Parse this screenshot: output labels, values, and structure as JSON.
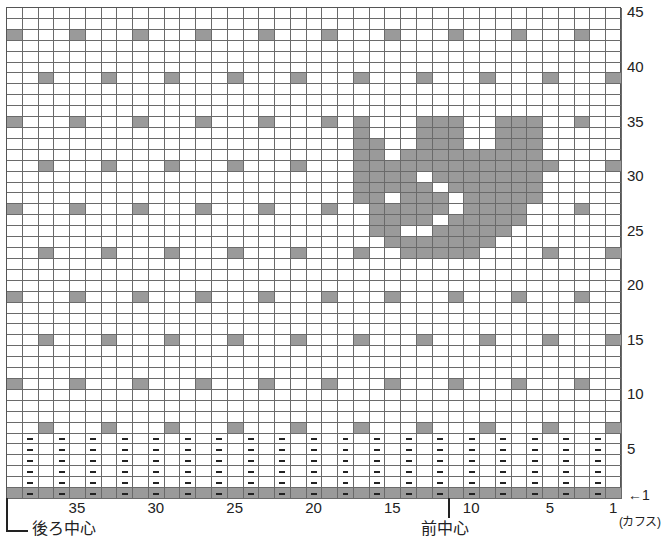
{
  "chart_data": {
    "type": "knitting-chart",
    "title": "",
    "columns": 39,
    "rows": 45,
    "column_numbering": "right-to-left, 1 at right edge",
    "row_numbering": "bottom-to-top, 1 at bottom edge",
    "x_tick_labels": [
      {
        "col": 35,
        "label": "35"
      },
      {
        "col": 30,
        "label": "30"
      },
      {
        "col": 25,
        "label": "25"
      },
      {
        "col": 20,
        "label": "20"
      },
      {
        "col": 15,
        "label": "15"
      },
      {
        "col": 10,
        "label": "10"
      },
      {
        "col": 5,
        "label": "5"
      },
      {
        "col": 1,
        "label": "1"
      }
    ],
    "y_tick_labels": [
      {
        "row": 5,
        "label": "5"
      },
      {
        "row": 10,
        "label": "10"
      },
      {
        "row": 15,
        "label": "15"
      },
      {
        "row": 20,
        "label": "20"
      },
      {
        "row": 25,
        "label": "25"
      },
      {
        "row": 30,
        "label": "30"
      },
      {
        "row": 35,
        "label": "35"
      },
      {
        "row": 40,
        "label": "40"
      },
      {
        "row": 45,
        "label": "45"
      }
    ],
    "start_row_marker": {
      "row": 1,
      "label": "←1"
    },
    "cuff_label": "(カフス)",
    "center_markers": [
      {
        "name": "back-center",
        "label": "後ろ中心",
        "at_col_boundary": 39.5
      },
      {
        "name": "front-center",
        "label": "前中心",
        "at_col_boundary": 11.5
      }
    ],
    "legend": {
      "grey": "contrast color stitch",
      "white": "main color stitch",
      "dash": "purl stitch"
    },
    "colors": {
      "contrast": "#9a9a9a",
      "main": "#ffffff",
      "grid_line": "#6a6a6a"
    },
    "ribbing": {
      "rows": [
        1,
        2,
        3,
        4,
        5,
        6
      ],
      "purl_columns": "even columns (2,4,...,38)",
      "band_row_filled": 1
    },
    "dot_pattern": [
      {
        "rows": [
          43,
          35,
          27,
          19,
          11
        ],
        "cols_mod4": 3
      },
      {
        "rows": [
          39,
          31,
          23,
          15,
          7
        ],
        "cols_mod4": 1
      }
    ],
    "dot_exclusions": [
      [
        35,
        15
      ],
      [
        27,
        11
      ],
      [
        23,
        9
      ]
    ],
    "motif_cat": {
      "35": [
        17,
        13,
        12,
        11,
        8,
        7,
        6
      ],
      "34": [
        17,
        13,
        12,
        11,
        8,
        7,
        6
      ],
      "33": [
        17,
        16,
        13,
        12,
        11,
        8,
        7,
        6
      ],
      "32": [
        17,
        16,
        14,
        13,
        12,
        11,
        10,
        9,
        8,
        7,
        6
      ],
      "31": [
        17,
        16,
        15,
        14,
        13,
        12,
        11,
        10,
        9,
        8,
        7,
        6
      ],
      "30": [
        17,
        16,
        15,
        14,
        12,
        11,
        10,
        9,
        8,
        7,
        6
      ],
      "29": [
        17,
        16,
        15,
        14,
        13,
        11,
        10,
        9,
        8,
        7,
        6
      ],
      "28": [
        17,
        16,
        14,
        13,
        12,
        10,
        9,
        8,
        7,
        6
      ],
      "27": [
        16,
        15,
        14,
        13,
        12,
        10,
        9,
        8,
        7
      ],
      "26": [
        16,
        15,
        14,
        13,
        11,
        10,
        9,
        8,
        7
      ],
      "25": [
        16,
        15,
        12,
        11,
        10,
        9,
        8
      ],
      "24": [
        15,
        14,
        13,
        12,
        11,
        10,
        9
      ],
      "23": [
        14,
        13,
        12,
        11,
        10
      ]
    }
  }
}
